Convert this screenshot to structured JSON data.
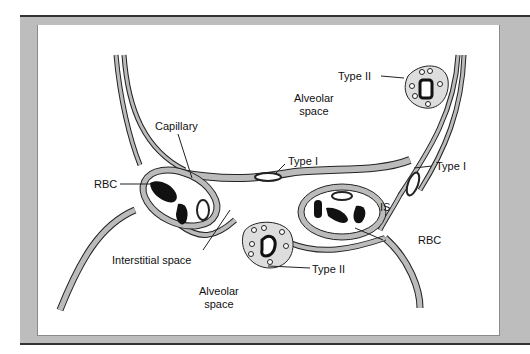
{
  "diagram": {
    "colors": {
      "frame": "#bdbdbd",
      "frame_line": "#333333",
      "panel": "#ffffff",
      "tissue": "#b8b8b8",
      "outline": "#222222",
      "rbc": "#111111"
    },
    "labels": {
      "alveolar_space_top_1": "Alveolar",
      "alveolar_space_top_2": "space",
      "alveolar_space_bottom_1": "Alveolar",
      "alveolar_space_bottom_2": "space",
      "capillary": "Capillary",
      "rbc_left": "RBC",
      "rbc_right": "RBC",
      "type_i_center": "Type I",
      "type_i_right": "Type I",
      "type_ii_top": "Type II",
      "type_ii_bottom": "Type II",
      "interstitial_space": "Interstitial space",
      "is": "IS"
    }
  }
}
